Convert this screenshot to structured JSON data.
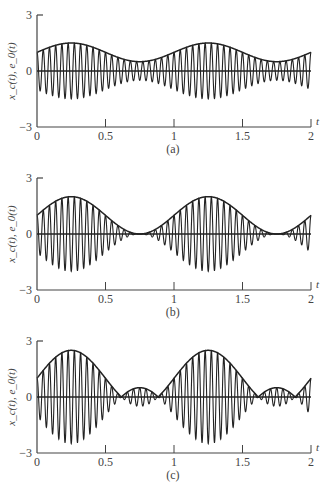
{
  "chart_data": [
    {
      "type": "line",
      "panel": "(a)",
      "title": "",
      "xlabel": "t",
      "ylabel": "x_c(t), e_0(t)",
      "xlim": [
        0,
        2
      ],
      "ylim": [
        -3,
        3
      ],
      "xticks": [
        "0",
        "0.5",
        "1",
        "1.5",
        "2"
      ],
      "yticks": [
        "3",
        "0",
        "-3"
      ],
      "grid": false,
      "series": [
        {
          "name": "x_c(t) (modulated carrier)",
          "carrier_cycles_per_unit": 22,
          "modulation_index": 0.5
        },
        {
          "name": "e_0(t) (envelope)",
          "x": [
            0,
            0.25,
            0.5,
            0.75,
            1.0,
            1.25,
            1.5,
            1.75,
            2.0
          ],
          "values": [
            1.0,
            1.5,
            1.0,
            0.5,
            1.0,
            1.5,
            1.0,
            0.5,
            1.0
          ]
        }
      ],
      "caption": "(a)"
    },
    {
      "type": "line",
      "panel": "(b)",
      "xlabel": "t",
      "ylabel": "x_c(t), e_0(t)",
      "xlim": [
        0,
        2
      ],
      "ylim": [
        -3,
        3
      ],
      "xticks": [
        "0",
        "0.5",
        "1",
        "1.5",
        "2"
      ],
      "yticks": [
        "3",
        "0",
        "-3"
      ],
      "grid": false,
      "series": [
        {
          "name": "x_c(t) (modulated carrier)",
          "carrier_cycles_per_unit": 22,
          "modulation_index": 1.0
        },
        {
          "name": "e_0(t) (envelope)",
          "x": [
            0,
            0.25,
            0.5,
            0.75,
            1.0,
            1.25,
            1.5,
            1.75,
            2.0
          ],
          "values": [
            1.0,
            2.0,
            1.0,
            0.0,
            1.0,
            2.0,
            1.0,
            0.0,
            1.0
          ]
        }
      ],
      "caption": "(b)"
    },
    {
      "type": "line",
      "panel": "(c)",
      "xlabel": "t",
      "ylabel": "x_c(t), e_0(t)",
      "xlim": [
        0,
        2
      ],
      "ylim": [
        -3,
        3
      ],
      "xticks": [
        "0",
        "0.5",
        "1",
        "1.5",
        "2"
      ],
      "yticks": [
        "3",
        "0",
        "-3"
      ],
      "grid": false,
      "series": [
        {
          "name": "x_c(t) (modulated carrier)",
          "carrier_cycles_per_unit": 22,
          "modulation_index": 1.5
        },
        {
          "name": "e_0(t) (envelope)",
          "x": [
            0,
            0.25,
            0.5,
            0.64,
            0.75,
            0.86,
            1.0,
            1.25,
            1.5,
            1.64,
            1.75,
            1.86,
            2.0
          ],
          "values": [
            1.0,
            2.5,
            1.0,
            0.0,
            0.5,
            0.0,
            1.0,
            2.5,
            1.0,
            0.0,
            0.5,
            0.0,
            1.0
          ]
        }
      ],
      "caption": "(c)"
    }
  ],
  "panels": [
    {
      "caption": "(a)",
      "ylabel": "x_c(t), e_0(t)",
      "t_label": "t",
      "ytick_top": "3",
      "ytick_zero": "0",
      "ytick_bottom": "−3",
      "xticks": [
        "0",
        "0.5",
        "1",
        "1.5",
        "2"
      ],
      "m": 0.5
    },
    {
      "caption": "(b)",
      "ylabel": "x_c(t), e_0(t)",
      "t_label": "t",
      "ytick_top": "3",
      "ytick_zero": "0",
      "ytick_bottom": "−3",
      "xticks": [
        "0",
        "0.5",
        "1",
        "1.5",
        "2"
      ],
      "m": 1.0
    },
    {
      "caption": "(c)",
      "ylabel": "x_c(t), e_0(t)",
      "t_label": "t",
      "ytick_top": "3",
      "ytick_zero": "0",
      "ytick_bottom": "−3",
      "xticks": [
        "0",
        "0.5",
        "1",
        "1.5",
        "2"
      ],
      "m": 1.5
    }
  ],
  "style": {
    "line_color": "#222222",
    "axis_color": "#444444",
    "carrier_freq": 22
  }
}
